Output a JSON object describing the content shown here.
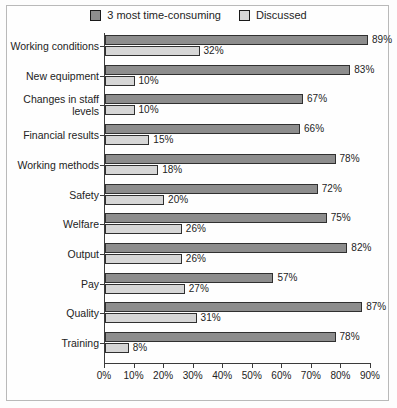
{
  "chart_data": {
    "type": "bar",
    "orientation": "horizontal",
    "title": "",
    "subtitle": "",
    "xlabel": "",
    "ylabel": "",
    "xlim": [
      0,
      90
    ],
    "xtick_labels": [
      "0%",
      "10%",
      "20%",
      "30%",
      "40%",
      "50%",
      "60%",
      "70%",
      "80%",
      "90%"
    ],
    "xtick_values": [
      0,
      10,
      20,
      30,
      40,
      50,
      60,
      70,
      80,
      90
    ],
    "grid": false,
    "legend_position": "top-center",
    "categories": [
      "Working conditions",
      "New equipment",
      "Changes in staff levels",
      "Financial results",
      "Working methods",
      "Safety",
      "Welfare",
      "Output",
      "Pay",
      "Quality",
      "Training"
    ],
    "series": [
      {
        "name": "3 most time-consuming",
        "color": "#8d8d8d",
        "values": [
          89,
          83,
          67,
          66,
          78,
          72,
          75,
          82,
          57,
          87,
          78
        ],
        "labels": [
          "89%",
          "83%",
          "67%",
          "66%",
          "78%",
          "72%",
          "75%",
          "82%",
          "57%",
          "87%",
          "78%"
        ]
      },
      {
        "name": "Discussed",
        "color": "#d6d6d6",
        "values": [
          32,
          10,
          10,
          15,
          18,
          20,
          26,
          26,
          27,
          31,
          8
        ],
        "labels": [
          "32%",
          "10%",
          "10%",
          "15%",
          "18%",
          "20%",
          "26%",
          "26%",
          "27%",
          "31%",
          "8%"
        ]
      }
    ]
  },
  "legend": {
    "entries": [
      {
        "label": "3 most time-consuming",
        "swatch": "dark"
      },
      {
        "label": "Discussed",
        "swatch": "light"
      }
    ]
  }
}
